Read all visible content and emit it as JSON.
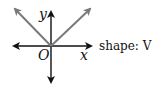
{
  "diagram": {
    "axis_labels": {
      "x": "x",
      "y": "y",
      "origin": "O"
    },
    "caption": "shape: V",
    "colors": {
      "axes": "#111111",
      "graph": "#7a7a7a"
    }
  }
}
